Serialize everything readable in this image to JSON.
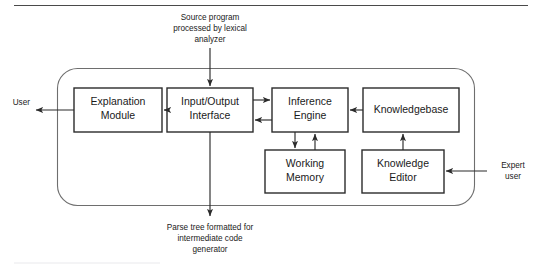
{
  "diagram": {
    "top_annotation": {
      "lines": [
        "Source program",
        "processed by lexical",
        "analyzer"
      ]
    },
    "bottom_annotation": {
      "lines": [
        "Parse tree formatted for",
        "intermediate code",
        "generator"
      ]
    },
    "external_actors": {
      "user": "User",
      "expert_user_lines": [
        "Expert",
        "user"
      ]
    },
    "nodes": [
      {
        "id": "explanation-module",
        "lines": [
          "Explanation",
          "Module"
        ]
      },
      {
        "id": "input-output-interface",
        "lines": [
          "Input/Output",
          "Interface"
        ]
      },
      {
        "id": "inference-engine",
        "lines": [
          "Inference",
          "Engine"
        ]
      },
      {
        "id": "knowledgebase",
        "lines": [
          "Knowledgebase"
        ]
      },
      {
        "id": "working-memory",
        "lines": [
          "Working",
          "Memory"
        ]
      },
      {
        "id": "knowledge-editor",
        "lines": [
          "Knowledge",
          "Editor"
        ]
      }
    ],
    "colors": {
      "node_stroke": "#2b2b2b",
      "node_fill": "#ffffff",
      "boundary_stroke": "#6e6e6e",
      "link_stroke": "#2b2b2b",
      "text": "#1a1a1a",
      "background": "#ffffff"
    }
  }
}
